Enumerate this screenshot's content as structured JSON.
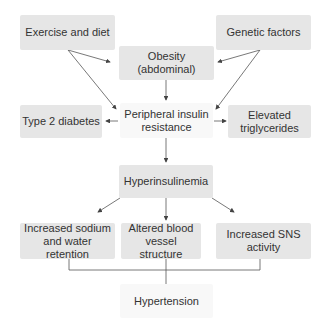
{
  "nodes": {
    "exercise": "Exercise and diet",
    "genetic": "Genetic factors",
    "obesity": "Obesity (abdominal)",
    "peripheral": "Peripheral insulin resistance",
    "type2": "Type 2 diabetes",
    "triglycerides": "Elevated triglycerides",
    "hyperinsulinemia": "Hyperinsulinemia",
    "sodium": "Increased sodium and water retention",
    "vessel": "Altered blood vessel structure",
    "sns": "Increased SNS activity",
    "hypertension": "Hypertension"
  },
  "colors": {
    "box": "#e6e6e6",
    "box_light": "#f8f8f8",
    "line": "#444444"
  }
}
